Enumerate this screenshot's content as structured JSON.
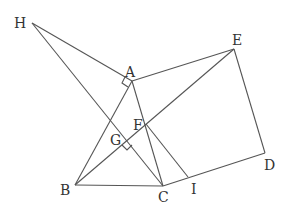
{
  "diagram": {
    "type": "geometry",
    "points": {
      "H": {
        "label": "H",
        "x": 32,
        "y": 23
      },
      "A": {
        "label": "A",
        "x": 132,
        "y": 81
      },
      "E": {
        "label": "E",
        "x": 234,
        "y": 49
      },
      "D": {
        "label": "D",
        "x": 265,
        "y": 153
      },
      "I": {
        "label": "I",
        "x": 188,
        "y": 177
      },
      "C": {
        "label": "C",
        "x": 163,
        "y": 186
      },
      "B": {
        "label": "B",
        "x": 75,
        "y": 185
      },
      "F": {
        "label": "F",
        "x": 146,
        "y": 124
      },
      "G": {
        "label": "G",
        "x": 127,
        "y": 141
      }
    },
    "segments": [
      "HA",
      "HC",
      "AE",
      "ED",
      "DC",
      "AB",
      "AC",
      "BE",
      "BC",
      "FI"
    ],
    "right_angle_marks": [
      "A (H-A-B)",
      "G (B-G-C)"
    ]
  }
}
